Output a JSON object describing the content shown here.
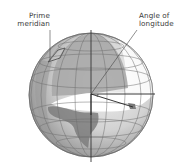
{
  "diagram": {
    "labels": {
      "prime_meridian_line1": "Prime",
      "prime_meridian_line2": "meridian",
      "angle_line1": "Angle of",
      "angle_line2": "longitude"
    },
    "colors": {
      "globe_light": "#e6e6e6",
      "globe_mid": "#bdbdbd",
      "globe_dark": "#8f8f8f",
      "meridian_plane": "#a9a9a9",
      "continent": "#7d7d7d",
      "grid": "#6f6f6f",
      "equator_plane": "#ffffff",
      "text": "#3a3a3a"
    }
  }
}
